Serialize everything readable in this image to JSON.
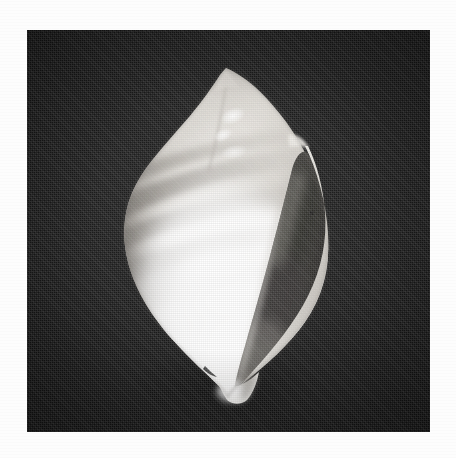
{
  "page": {
    "background_color": "#fdfdfd",
    "width": 456,
    "height": 458,
    "caption": ""
  },
  "plate": {
    "name": "photographic-plate",
    "background_color": "#181818",
    "left": 27,
    "top": 30,
    "width": 403,
    "height": 402,
    "description": "Dark halftone-printed photographic plate"
  },
  "subject": {
    "name": "seashell",
    "common_name": "Sea shell",
    "orientation": "apertural view, apex up",
    "highlight_color": "#ffffff",
    "body_color": "#f2f0ec",
    "shadow_color": "#6e6a66",
    "aperture_color": "#4a4744",
    "parts": [
      {
        "name": "apex",
        "label": "Apex"
      },
      {
        "name": "spire",
        "label": "Spire"
      },
      {
        "name": "body-whorl",
        "label": "Body whorl"
      },
      {
        "name": "outer-lip",
        "label": "Outer lip"
      },
      {
        "name": "aperture",
        "label": "Aperture"
      },
      {
        "name": "columella",
        "label": "Columella"
      },
      {
        "name": "siphonal-canal",
        "label": "Siphonal canal"
      },
      {
        "name": "spiral-bands",
        "label": "Spiral colour bands"
      }
    ]
  },
  "colors": {
    "plate_dark": "#181818",
    "plate_mid": "#262626",
    "shell_white": "#ffffff",
    "shell_cream": "#f0eee9",
    "shell_band": "#8d8984",
    "shell_deep_shadow": "#3c3a37",
    "paper": "#fdfdfd"
  }
}
